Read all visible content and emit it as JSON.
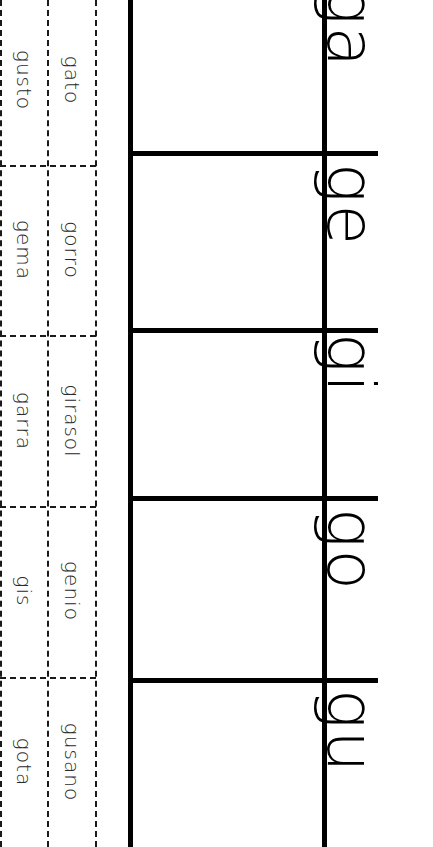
{
  "worksheet": {
    "syllables": [
      "ga",
      "ge",
      "gi",
      "go",
      "gu"
    ],
    "word_columns": {
      "inner": [
        "gato",
        "gorro",
        "girasol",
        "genio",
        "gusano"
      ],
      "outer": [
        "gusto",
        "gema",
        "garra",
        "gis",
        "gota"
      ]
    },
    "colors": {
      "ink": "#000000",
      "background": "#ffffff",
      "word_text": "#2a2a2a"
    }
  }
}
